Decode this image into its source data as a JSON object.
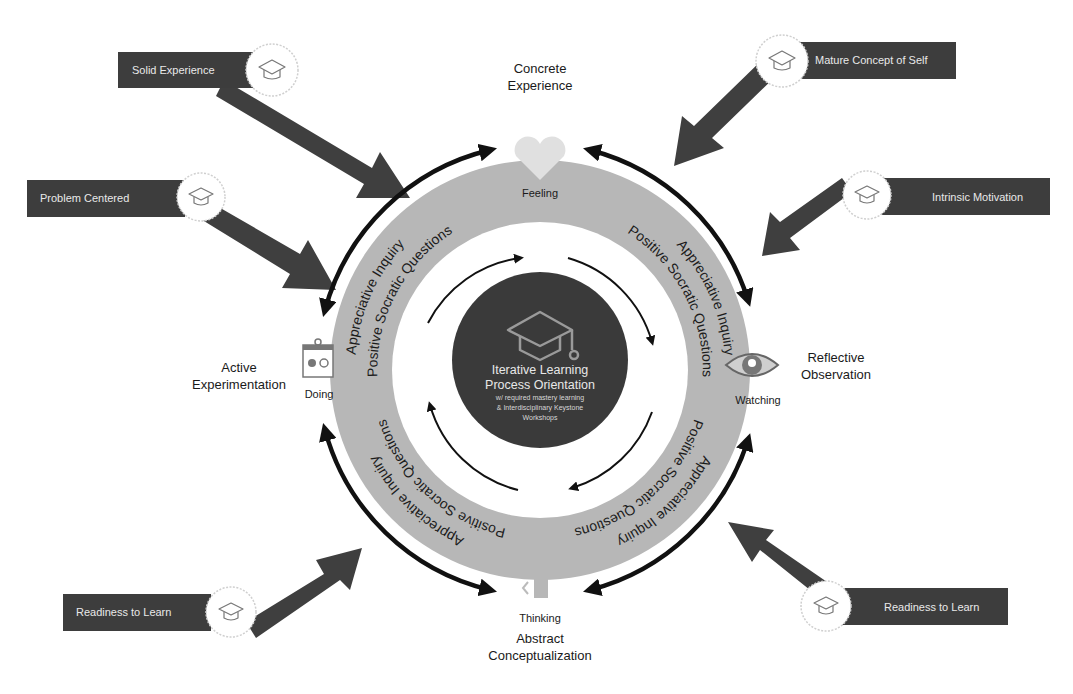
{
  "diagram": {
    "center": {
      "icon": "graduation-cap-icon",
      "title_line1": "Iterative Learning",
      "title_line2": "Process Orientation",
      "sub_line1": "w/ required mastery learning",
      "sub_line2": "& Interdisciplinary Keystone",
      "sub_line3": "Workshops"
    },
    "stages": {
      "top": {
        "line1": "Concrete",
        "line2": "Experience",
        "mode": "Feeling",
        "icon": "heart-icon"
      },
      "right": {
        "line1": "Reflective",
        "line2": "Observation",
        "mode": "Watching",
        "icon": "eye-icon"
      },
      "bottom": {
        "line1": "Abstract",
        "line2": "Conceptualization",
        "mode": "Thinking",
        "icon": "brain-icon"
      },
      "left": {
        "line1": "Active",
        "line2": "Experimentation",
        "mode": "Doing",
        "icon": "clipboard-icon"
      }
    },
    "ring": {
      "outer_label": "Appreciative Inquiry",
      "inner_label": "Positive Socratic Questions"
    },
    "inputs": [
      {
        "id": "tl1",
        "label": "Solid Experience",
        "icon": "graduation-cap-icon"
      },
      {
        "id": "tl2",
        "label": "Problem Centered",
        "icon": "graduation-cap-icon"
      },
      {
        "id": "tr1",
        "label": "Mature Concept of Self",
        "icon": "graduation-cap-icon"
      },
      {
        "id": "tr2",
        "label": "Intrinsic Motivation",
        "icon": "graduation-cap-icon"
      },
      {
        "id": "bl",
        "label": "Readiness to Learn",
        "icon": "graduation-cap-icon"
      },
      {
        "id": "br",
        "label": "Readiness to Learn",
        "icon": "graduation-cap-icon"
      }
    ],
    "colors": {
      "label_box": "#3d3d3d",
      "disc": "#b7b7b7",
      "core": "#3a3a3a",
      "arrow": "#3f3f3f"
    }
  }
}
